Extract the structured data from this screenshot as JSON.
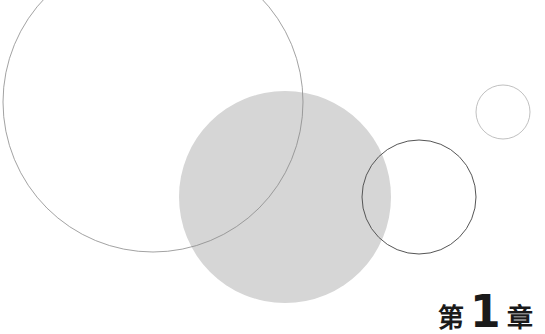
{
  "page": {
    "background": "#ffffff",
    "chapter_heading": {
      "prefix": "第",
      "number": "1",
      "suffix": "章"
    }
  },
  "decorations": {
    "circles": [
      {
        "name": "large-outline-circle",
        "cx": 153,
        "cy": 102,
        "r": 150,
        "fill": "none",
        "stroke": "#8a8a8a",
        "stroke_width": 0.8
      },
      {
        "name": "gray-filled-circle",
        "cx": 285,
        "cy": 197,
        "r": 106,
        "fill": "#d6d6d6",
        "opacity": 0.9
      },
      {
        "name": "medium-outline-circle",
        "cx": 419,
        "cy": 197,
        "r": 57,
        "fill": "none",
        "stroke": "#555555",
        "stroke_width": 1
      },
      {
        "name": "small-outline-circle",
        "cx": 503,
        "cy": 112,
        "r": 27,
        "fill": "none",
        "stroke": "#b0b0b0",
        "stroke_width": 0.8
      }
    ]
  }
}
